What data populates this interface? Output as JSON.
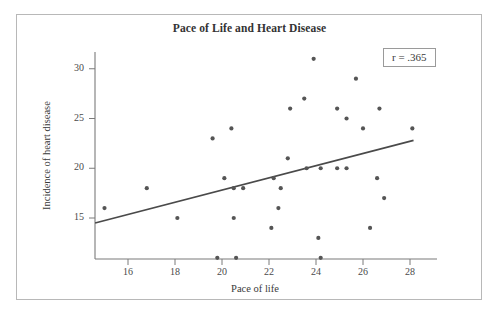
{
  "figure": {
    "title": "Pace of Life and Heart Disease",
    "annotation_box": {
      "symbol": "r",
      "text": "r = .365"
    }
  },
  "chart_data": {
    "type": "scatter",
    "title": "Pace of Life and Heart Disease",
    "xlabel": "Pace of life",
    "ylabel": "Incidence of heart disease",
    "xlim": [
      14.6,
      28.8
    ],
    "ylim": [
      10.5,
      32.3
    ],
    "xticks": [
      16,
      18,
      20,
      22,
      24,
      26,
      28
    ],
    "yticks": [
      15,
      20,
      25,
      30
    ],
    "grid": false,
    "legend": null,
    "annotations": [
      {
        "text": "r = .365",
        "type": "boxed-correlation",
        "value": 0.365
      }
    ],
    "series": [
      {
        "name": "Cities",
        "marker": "filled-circle",
        "color": "#555555",
        "points": [
          [
            15.0,
            16.0
          ],
          [
            16.8,
            18.0
          ],
          [
            18.1,
            15.0
          ],
          [
            19.6,
            23.0
          ],
          [
            19.8,
            11.0
          ],
          [
            20.1,
            19.0
          ],
          [
            20.4,
            24.0
          ],
          [
            20.5,
            18.0
          ],
          [
            20.5,
            15.0
          ],
          [
            20.6,
            11.0
          ],
          [
            20.9,
            18.0
          ],
          [
            22.1,
            14.0
          ],
          [
            22.2,
            19.0
          ],
          [
            22.4,
            16.0
          ],
          [
            22.5,
            18.0
          ],
          [
            22.8,
            21.0
          ],
          [
            22.9,
            26.0
          ],
          [
            23.5,
            27.0
          ],
          [
            23.6,
            20.0
          ],
          [
            23.9,
            31.0
          ],
          [
            24.1,
            13.0
          ],
          [
            24.2,
            11.0
          ],
          [
            24.2,
            20.0
          ],
          [
            24.9,
            20.0
          ],
          [
            24.9,
            26.0
          ],
          [
            25.3,
            20.0
          ],
          [
            25.3,
            25.0
          ],
          [
            25.7,
            29.0
          ],
          [
            26.0,
            24.0
          ],
          [
            26.3,
            14.0
          ],
          [
            26.6,
            19.0
          ],
          [
            26.7,
            26.0
          ],
          [
            26.9,
            17.0
          ],
          [
            28.1,
            24.0
          ]
        ]
      }
    ],
    "regression_line": {
      "name": "Least-squares regression line",
      "color": "#4a4a4a",
      "x_start": 14.6,
      "y_start": 14.5,
      "x_end": 28.15,
      "y_end": 22.8
    }
  },
  "axes": {
    "x": {
      "title": "Pace of life",
      "ticks": [
        "16",
        "18",
        "20",
        "22",
        "24",
        "26",
        "28"
      ]
    },
    "y": {
      "title": "Incidence of heart disease",
      "ticks": [
        "30",
        "25",
        "20",
        "15"
      ]
    }
  },
  "colors": {
    "marker": "#555555",
    "line": "#4a4a4a",
    "axis": "#7a7a7a",
    "frame": "#b8b8b8",
    "text": "#3a3a3a"
  }
}
